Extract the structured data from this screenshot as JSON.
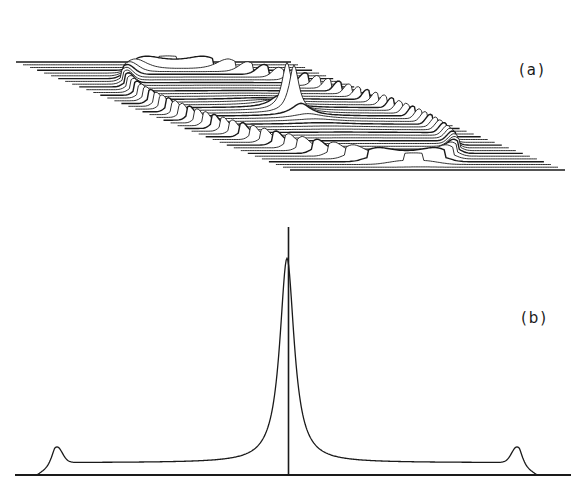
{
  "chart_data": [
    {
      "type": "surface",
      "panel": "(a)",
      "title": "",
      "description": "3D stacked-trace (waterfall) plot: flat plateau with raised rim edges and a sharp central double peak",
      "xlabel": "",
      "ylabel": "",
      "grid": false,
      "legend": "none",
      "features": {
        "central_peak_height": 1.0,
        "secondary_peak_height": 0.8,
        "plateau_level": 0.05,
        "edge_rim_height": 0.12,
        "trace_count": 40
      }
    },
    {
      "type": "line",
      "panel": "(b)",
      "title": "",
      "xlabel": "",
      "ylabel": "",
      "grid": false,
      "legend": "none",
      "xlim": [
        -1,
        1
      ],
      "ylim": [
        0,
        1.13
      ],
      "x": [
        -1.0,
        -0.95,
        -0.91,
        -0.87,
        -0.8,
        -0.6,
        -0.4,
        -0.25,
        -0.15,
        -0.08,
        -0.04,
        -0.02,
        0.0,
        0.02,
        0.04,
        0.08,
        0.15,
        0.25,
        0.4,
        0.6,
        0.8,
        0.87,
        0.91,
        0.95,
        1.0
      ],
      "values": [
        0.0,
        0.12,
        0.12,
        0.07,
        0.055,
        0.055,
        0.07,
        0.11,
        0.2,
        0.38,
        0.62,
        0.83,
        1.0,
        0.83,
        0.62,
        0.38,
        0.2,
        0.11,
        0.07,
        0.055,
        0.055,
        0.07,
        0.12,
        0.12,
        0.0
      ],
      "annotations": [
        "vertical center line at x = 0"
      ]
    }
  ],
  "labels": {
    "panel_a": "(a)",
    "panel_b": "(b)"
  },
  "colors": {
    "ink": "#1a1a1a",
    "background": "#ffffff"
  }
}
